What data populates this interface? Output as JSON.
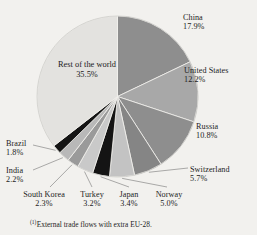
{
  "chart_data": {
    "type": "pie",
    "title": "",
    "subtitle": "",
    "xlabel": "",
    "ylabel": "",
    "legend_position": "none",
    "grid": false,
    "value_unit": "%",
    "start_angle_deg": 0,
    "direction": "clockwise",
    "categories": [
      "China",
      "United States",
      "Russia",
      "Switzerland",
      "Norway",
      "Japan",
      "Turkey",
      "South Korea",
      "India",
      "Brazil",
      "Rest of the world"
    ],
    "values": [
      17.9,
      12.2,
      10.8,
      5.7,
      5.0,
      3.4,
      3.2,
      2.3,
      2.2,
      1.8,
      35.5
    ],
    "slices": [
      {
        "label": "China",
        "value": 17.9,
        "value_text": "17.9%",
        "color": "#8e8e8e"
      },
      {
        "label": "United States",
        "value": 12.2,
        "value_text": "12.2%",
        "color": "#a8a8a8"
      },
      {
        "label": "Russia",
        "value": 10.8,
        "value_text": "10.8%",
        "color": "#8e8e8e"
      },
      {
        "label": "Switzerland",
        "value": 5.7,
        "value_text": "5.7%",
        "color": "#858585"
      },
      {
        "label": "Norway",
        "value": 5.0,
        "value_text": "5.0%",
        "color": "#c3c3c3"
      },
      {
        "label": "Japan",
        "value": 3.4,
        "value_text": "3.4%",
        "color": "#141414"
      },
      {
        "label": "Turkey",
        "value": 3.2,
        "value_text": "3.2%",
        "color": "#c9c9c9"
      },
      {
        "label": "South Korea",
        "value": 2.3,
        "value_text": "2.3%",
        "color": "#9a9a9a"
      },
      {
        "label": "India",
        "value": 2.2,
        "value_text": "2.2%",
        "color": "#b8b8b8"
      },
      {
        "label": "Brazil",
        "value": 1.8,
        "value_text": "1.8%",
        "color": "#141414"
      },
      {
        "label": "Rest of the world",
        "value": 35.5,
        "value_text": "35.5%",
        "color": "#e3e2df"
      }
    ],
    "annotations": {
      "footnote_marker": "(1)",
      "footnote_text": "External trade flows with extra EU-28."
    }
  },
  "labels": {
    "china": {
      "name": "China",
      "pct": "17.9%"
    },
    "united_states": {
      "name": "United States",
      "pct": "12.2%"
    },
    "russia": {
      "name": "Russia",
      "pct": "10.8%"
    },
    "switzerland": {
      "name": "Switzerland",
      "pct": "5.7%"
    },
    "norway": {
      "name": "Norway",
      "pct": "5.0%"
    },
    "japan": {
      "name": "Japan",
      "pct": "3.4%"
    },
    "turkey": {
      "name": "Turkey",
      "pct": "3.2%"
    },
    "south_korea": {
      "name": "South Korea",
      "pct": "2.3%"
    },
    "india": {
      "name": "India",
      "pct": "2.2%"
    },
    "brazil": {
      "name": "Brazil",
      "pct": "1.8%"
    },
    "rest": {
      "line1": "Rest of",
      "line2": "the world",
      "pct": "35.5%"
    }
  },
  "footnote": {
    "marker": "(1)",
    "text": "External trade flows with extra EU-28."
  },
  "colors": {
    "background": "#f2f1ee",
    "text": "#1d1d1d",
    "leader_line": "#6b6b6b",
    "slice_edge": "#f2f1ee"
  }
}
